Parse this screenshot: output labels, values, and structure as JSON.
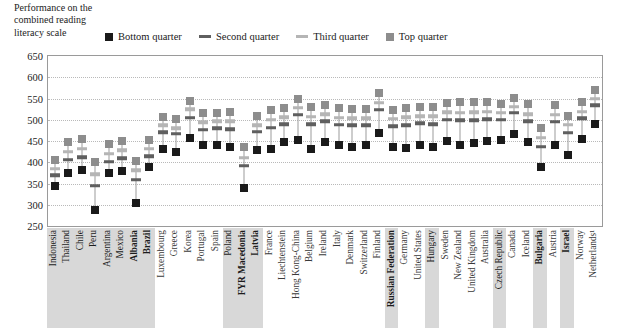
{
  "title": {
    "lines": [
      "Performance on the",
      "combined reading",
      "literacy scale"
    ]
  },
  "legend": {
    "position": "top",
    "items": [
      {
        "label": "Bottom quarter",
        "marker": "square",
        "color": "#1a1a1a",
        "name": "legend-bottom-quarter"
      },
      {
        "label": "Second quarter",
        "marker": "dash",
        "color": "#5f5f5f",
        "name": "legend-second-quarter"
      },
      {
        "label": "Third quarter",
        "marker": "dash",
        "color": "#b5b5b5",
        "name": "legend-third-quarter"
      },
      {
        "label": "Top quarter",
        "marker": "square",
        "color": "#8d8d8d",
        "name": "legend-top-quarter"
      }
    ]
  },
  "axis": {
    "y_ticks": [
      650,
      600,
      550,
      500,
      450,
      400,
      350,
      300,
      250
    ],
    "y_min": 250,
    "y_max": 650,
    "grid": true
  },
  "chart_data": {
    "type": "scatter",
    "title": "Performance on the combined reading literacy scale",
    "xlabel": "",
    "ylabel": "Performance on the combined reading literacy scale",
    "ylim": [
      250,
      650
    ],
    "ytick_step": 50,
    "grid": true,
    "legend_position": "top",
    "categories": [
      "Indonesia",
      "Thailand",
      "Chile",
      "Peru",
      "Argentina",
      "Mexico",
      "Albania",
      "Brazil",
      "Luxembourg",
      "Greece",
      "Korea",
      "Portugal",
      "Spain",
      "Poland",
      "FYR Macedonia",
      "Latvia",
      "France",
      "Liechtenstein",
      "Hong Kong-China",
      "Belgium",
      "Ireland",
      "Italy",
      "Denmark",
      "Switzerland",
      "Finland",
      "Russian Federation",
      "Germany",
      "United States",
      "Hungary",
      "Sweden",
      "New Zealand",
      "United Kingdom",
      "Australia",
      "Czech Republic",
      "Canada",
      "Iceland",
      "Bulgaria",
      "Austria",
      "Israel",
      "Norway",
      "Netherlands¹"
    ],
    "highlighted_categories": [
      "Indonesia",
      "Thailand",
      "Chile",
      "Peru",
      "Argentina",
      "Mexico",
      "Albania",
      "Brazil",
      "Poland",
      "FYR Macedonia",
      "Latvia",
      "Russian Federation",
      "Hungary",
      "Czech Republic",
      "Bulgaria",
      "Israel"
    ],
    "bold_categories": [
      "Albania",
      "Brazil",
      "FYR Macedonia",
      "Latvia",
      "Russian Federation",
      "Bulgaria",
      "Israel"
    ],
    "series": [
      {
        "name": "Bottom quarter",
        "marker": "square",
        "color": "#1a1a1a",
        "values": [
          345,
          375,
          382,
          288,
          375,
          380,
          305,
          390,
          432,
          424,
          458,
          440,
          440,
          435,
          340,
          430,
          432,
          448,
          452,
          432,
          448,
          441,
          436,
          440,
          470,
          436,
          434,
          440,
          436,
          450,
          441,
          446,
          449,
          452,
          466,
          447,
          388,
          440,
          418,
          455,
          490
        ]
      },
      {
        "name": "Second quarter",
        "marker": "dash",
        "color": "#5f5f5f",
        "values": [
          370,
          406,
          412,
          345,
          401,
          410,
          359,
          414,
          471,
          467,
          505,
          477,
          480,
          478,
          392,
          472,
          481,
          490,
          512,
          489,
          497,
          488,
          487,
          487,
          524,
          485,
          487,
          492,
          490,
          500,
          499,
          499,
          501,
          500,
          516,
          497,
          437,
          495,
          470,
          503,
          534
        ]
      },
      {
        "name": "Third quarter",
        "marker": "dash",
        "color": "#b5b5b5",
        "values": [
          385,
          425,
          432,
          372,
          420,
          428,
          381,
          432,
          487,
          480,
          525,
          494,
          496,
          497,
          411,
          487,
          500,
          506,
          528,
          507,
          513,
          505,
          503,
          504,
          540,
          502,
          506,
          508,
          508,
          518,
          517,
          518,
          519,
          516,
          531,
          513,
          458,
          512,
          488,
          519,
          549
        ]
      },
      {
        "name": "Top quarter",
        "marker": "square",
        "color": "#8d8d8d",
        "values": [
          405,
          447,
          455,
          400,
          442,
          450,
          404,
          452,
          507,
          502,
          545,
          516,
          517,
          518,
          435,
          508,
          522,
          527,
          548,
          530,
          535,
          527,
          525,
          526,
          562,
          524,
          528,
          531,
          530,
          540,
          541,
          541,
          541,
          538,
          552,
          536,
          480,
          535,
          510,
          541,
          570
        ]
      }
    ]
  }
}
